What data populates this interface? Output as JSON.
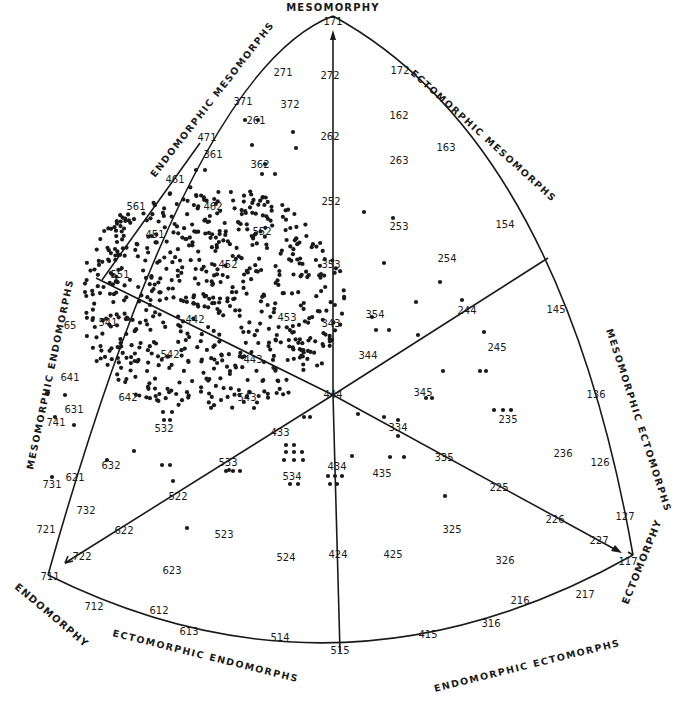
{
  "poles": {
    "mesomorphy": "MESOMORPHY",
    "endomorphy": "ENDOMORPHY",
    "ectomorphy": "ECTOMORPHY"
  },
  "regions": {
    "endomorphic_mesomorphs": "ENDOMORPHIC MESOMORPHS",
    "ectomorphic_mesomorphs": "ECTOMORPHIC MESOMORPHS",
    "mesomorphic_endomorphs": "MESOMORPHIC ENDOMORPHS",
    "mesomorphic_ectomorphs": "MESOMORPHIC ECTOMORPHS",
    "ectomorphic_endomorphs": "ECTOMORPHIC ENDOMORPHS",
    "endomorphic_ectomorphs": "ENDOMORPHIC ECTOMORPHS"
  },
  "somatotype_labels": [
    {
      "t": "171",
      "x": 333,
      "y": 22
    },
    {
      "t": "272",
      "x": 330,
      "y": 76
    },
    {
      "t": "271",
      "x": 283,
      "y": 73
    },
    {
      "t": "172",
      "x": 400,
      "y": 71
    },
    {
      "t": "371",
      "x": 243,
      "y": 102
    },
    {
      "t": "372",
      "x": 290,
      "y": 105
    },
    {
      "t": "261",
      "x": 256,
      "y": 121
    },
    {
      "t": "162",
      "x": 399,
      "y": 116
    },
    {
      "t": "163",
      "x": 446,
      "y": 148
    },
    {
      "t": "263",
      "x": 399,
      "y": 161
    },
    {
      "t": "471",
      "x": 207,
      "y": 138
    },
    {
      "t": "361",
      "x": 213,
      "y": 155
    },
    {
      "t": "362",
      "x": 260,
      "y": 165
    },
    {
      "t": "262",
      "x": 330,
      "y": 137
    },
    {
      "t": "461",
      "x": 175,
      "y": 180
    },
    {
      "t": "462",
      "x": 213,
      "y": 207
    },
    {
      "t": "561",
      "x": 136,
      "y": 207
    },
    {
      "t": "252",
      "x": 331,
      "y": 202
    },
    {
      "t": "253",
      "x": 399,
      "y": 227
    },
    {
      "t": "154",
      "x": 505,
      "y": 225
    },
    {
      "t": "451",
      "x": 155,
      "y": 235
    },
    {
      "t": "552",
      "x": 262,
      "y": 232
    },
    {
      "t": "452",
      "x": 228,
      "y": 265
    },
    {
      "t": "353",
      "x": 331,
      "y": 265
    },
    {
      "t": "254",
      "x": 447,
      "y": 259
    },
    {
      "t": "551",
      "x": 120,
      "y": 275
    },
    {
      "t": "354",
      "x": 375,
      "y": 315
    },
    {
      "t": "244",
      "x": 467,
      "y": 311
    },
    {
      "t": "145",
      "x": 556,
      "y": 310
    },
    {
      "t": "65",
      "x": 70,
      "y": 326
    },
    {
      "t": "541",
      "x": 108,
      "y": 323
    },
    {
      "t": "442",
      "x": 195,
      "y": 320
    },
    {
      "t": "453",
      "x": 287,
      "y": 318
    },
    {
      "t": "343",
      "x": 331,
      "y": 324
    },
    {
      "t": "542",
      "x": 170,
      "y": 355
    },
    {
      "t": "443",
      "x": 253,
      "y": 360
    },
    {
      "t": "344",
      "x": 368,
      "y": 356
    },
    {
      "t": "245",
      "x": 497,
      "y": 348
    },
    {
      "t": "641",
      "x": 70,
      "y": 378
    },
    {
      "t": "642",
      "x": 128,
      "y": 398
    },
    {
      "t": "444",
      "x": 333,
      "y": 395
    },
    {
      "t": "345",
      "x": 423,
      "y": 393
    },
    {
      "t": "631",
      "x": 74,
      "y": 410
    },
    {
      "t": "741",
      "x": 56,
      "y": 423
    },
    {
      "t": "543",
      "x": 247,
      "y": 398
    },
    {
      "t": "136",
      "x": 596,
      "y": 395
    },
    {
      "t": "532",
      "x": 164,
      "y": 429
    },
    {
      "t": "334",
      "x": 398,
      "y": 428
    },
    {
      "t": "235",
      "x": 508,
      "y": 420
    },
    {
      "t": "433",
      "x": 280,
      "y": 433
    },
    {
      "t": "632",
      "x": 111,
      "y": 466
    },
    {
      "t": "533",
      "x": 228,
      "y": 463
    },
    {
      "t": "534",
      "x": 292,
      "y": 477
    },
    {
      "t": "434",
      "x": 337,
      "y": 467
    },
    {
      "t": "435",
      "x": 382,
      "y": 474
    },
    {
      "t": "335",
      "x": 444,
      "y": 458
    },
    {
      "t": "236",
      "x": 563,
      "y": 454
    },
    {
      "t": "126",
      "x": 600,
      "y": 463
    },
    {
      "t": "621",
      "x": 75,
      "y": 478
    },
    {
      "t": "731",
      "x": 52,
      "y": 485
    },
    {
      "t": "732",
      "x": 86,
      "y": 511
    },
    {
      "t": "522",
      "x": 178,
      "y": 497
    },
    {
      "t": "225",
      "x": 499,
      "y": 488
    },
    {
      "t": "325",
      "x": 452,
      "y": 530
    },
    {
      "t": "721",
      "x": 46,
      "y": 530
    },
    {
      "t": "622",
      "x": 124,
      "y": 531
    },
    {
      "t": "523",
      "x": 224,
      "y": 535
    },
    {
      "t": "226",
      "x": 555,
      "y": 520
    },
    {
      "t": "127",
      "x": 625,
      "y": 517
    },
    {
      "t": "722",
      "x": 82,
      "y": 557
    },
    {
      "t": "524",
      "x": 286,
      "y": 558
    },
    {
      "t": "424",
      "x": 338,
      "y": 555
    },
    {
      "t": "425",
      "x": 393,
      "y": 555
    },
    {
      "t": "227",
      "x": 599,
      "y": 541
    },
    {
      "t": "326",
      "x": 505,
      "y": 561
    },
    {
      "t": "117",
      "x": 628,
      "y": 562
    },
    {
      "t": "711",
      "x": 50,
      "y": 577
    },
    {
      "t": "623",
      "x": 172,
      "y": 571
    },
    {
      "t": "712",
      "x": 94,
      "y": 607
    },
    {
      "t": "612",
      "x": 159,
      "y": 611
    },
    {
      "t": "216",
      "x": 520,
      "y": 601
    },
    {
      "t": "613",
      "x": 189,
      "y": 632
    },
    {
      "t": "514",
      "x": 280,
      "y": 638
    },
    {
      "t": "415",
      "x": 428,
      "y": 635
    },
    {
      "t": "316",
      "x": 491,
      "y": 624
    },
    {
      "t": "217",
      "x": 585,
      "y": 595
    },
    {
      "t": "515",
      "x": 340,
      "y": 651
    }
  ]
}
